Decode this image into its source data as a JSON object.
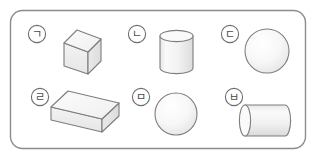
{
  "figure": {
    "frame": {
      "shape": "rounded-rectangle",
      "stroke_color": "#8c8c8c",
      "fill_color": "#ffffff",
      "corner_radius": 12
    },
    "palette": {
      "outline": "#7d7d7d",
      "label_text": "#4a4a4a",
      "label_ring": "#6e6e6e",
      "face_light": "#fbfbfb",
      "face_mid": "#f0f0f0",
      "face_dark": "#e2e2e2",
      "shading_top": "#f7f7f7",
      "shading_bottom": "#e9e9e9"
    },
    "items": [
      {
        "label": "㉠",
        "label_letter": "ㄱ",
        "shape_name": "cube",
        "shape_kind": "cube",
        "row": 1,
        "column": 1
      },
      {
        "label": "㉡",
        "label_letter": "ㄴ",
        "shape_name": "vertical cylinder",
        "shape_kind": "cylinder-vertical",
        "row": 1,
        "column": 2
      },
      {
        "label": "㉢",
        "label_letter": "ㄷ",
        "shape_name": "sphere (large)",
        "shape_kind": "sphere",
        "row": 1,
        "column": 3
      },
      {
        "label": "㉣",
        "label_letter": "ㄹ",
        "shape_name": "rectangular prism",
        "shape_kind": "cuboid",
        "row": 2,
        "column": 1
      },
      {
        "label": "㉤",
        "label_letter": "ㅁ",
        "shape_name": "sphere (small)",
        "shape_kind": "sphere",
        "row": 2,
        "column": 2
      },
      {
        "label": "㉥",
        "label_letter": "ㅂ",
        "shape_name": "horizontal cylinder",
        "shape_kind": "cylinder-horizontal",
        "row": 2,
        "column": 3
      }
    ]
  }
}
